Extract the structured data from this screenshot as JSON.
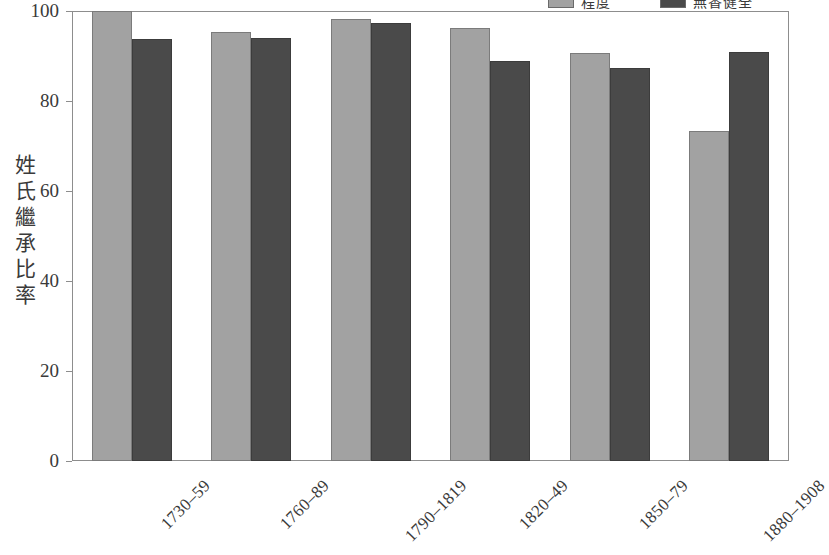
{
  "chart_data": {
    "type": "bar",
    "title": "",
    "xlabel": "",
    "ylabel": "姓氏繼承比率",
    "ylim": [
      0,
      100
    ],
    "yticks": [
      0,
      20,
      40,
      60,
      80,
      100
    ],
    "grid": false,
    "legend_position": "top-right",
    "categories": [
      "1730–59",
      "1760–89",
      "1790–1819",
      "1820–49",
      "1850–79",
      "1880–1908"
    ],
    "series": [
      {
        "name": "程度",
        "color": "#a2a2a2",
        "values": [
          100.0,
          95.3,
          98.2,
          96.2,
          90.7,
          73.4
        ]
      },
      {
        "name": "無香健全",
        "color": "#4a4a4a",
        "values": [
          93.7,
          93.9,
          97.4,
          89.0,
          87.3,
          90.9
        ]
      }
    ]
  },
  "legend": {
    "entries": [
      {
        "label": "程度",
        "swatch": "light-gray-swatch"
      },
      {
        "label": "無香健全",
        "swatch": "dark-gray-swatch"
      }
    ]
  },
  "axes": {
    "y_title": "姓氏繼承比率",
    "y_tick_labels": [
      "100",
      "80",
      "60",
      "40",
      "20",
      "0"
    ],
    "x_tick_labels": [
      "1730–59",
      "1760–89",
      "1790–1819",
      "1820–49",
      "1850–79",
      "1880–1908"
    ]
  },
  "colors": {
    "series_light": "#a2a2a2",
    "series_dark": "#4a4a4a",
    "axis": "#8d8d8d",
    "text": "#3a3a3a",
    "background": "#ffffff"
  }
}
